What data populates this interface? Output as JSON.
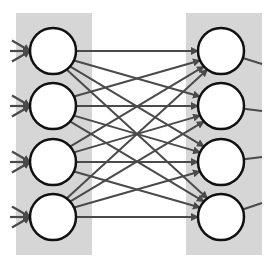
{
  "diagram": {
    "type": "fully-connected-layer",
    "colors": {
      "background": "#ffffff",
      "panel": "#d6d6d6",
      "node_fill": "#ffffff",
      "node_stroke": "#111111",
      "edge": "#4a4a4a"
    },
    "left_layer": {
      "panel": {
        "x": 16,
        "y": 13,
        "w": 76,
        "h": 242
      },
      "node_cx": 53,
      "node_r": 23,
      "node_cy": [
        51,
        106,
        162,
        217
      ]
    },
    "right_layer": {
      "panel": {
        "x": 186,
        "y": 13,
        "w": 76,
        "h": 242
      },
      "node_cx": 221,
      "node_r": 23,
      "node_cy": [
        51,
        106,
        162,
        217
      ]
    },
    "incoming_edges_per_node": 3,
    "outgoing_edge_ends": [
      {
        "x": 262,
        "y": 64
      },
      {
        "x": 262,
        "y": 111
      },
      {
        "x": 262,
        "y": 157
      },
      {
        "x": 262,
        "y": 203
      }
    ]
  }
}
